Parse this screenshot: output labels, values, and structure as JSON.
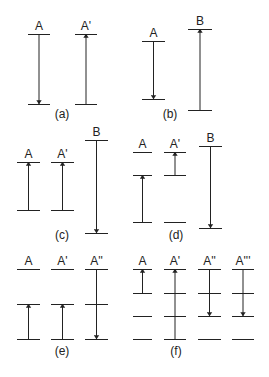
{
  "figure": {
    "stroke_color": "#222222",
    "background": "#ffffff",
    "panels": [
      {
        "id": "a",
        "caption": "(a)",
        "caption_pos": [
          62,
          118
        ],
        "columns": [
          {
            "label": "A",
            "x1": 28,
            "x2": 50,
            "levels": [
              34,
              104
            ],
            "arrow": {
              "from": 34,
              "to": 104,
              "direction": "down"
            }
          },
          {
            "label": "A'",
            "x1": 75,
            "x2": 97,
            "levels": [
              34,
              104
            ],
            "arrow": {
              "from": 104,
              "to": 34,
              "direction": "up"
            }
          }
        ]
      },
      {
        "id": "b",
        "caption": "(b)",
        "caption_pos": [
          170,
          118
        ],
        "columns": [
          {
            "label": "A",
            "x1": 142,
            "x2": 165,
            "levels": [
              41,
              99
            ],
            "arrow": {
              "from": 41,
              "to": 99,
              "direction": "down"
            }
          },
          {
            "label": "B",
            "x1": 188,
            "x2": 212,
            "levels": [
              29,
              110
            ],
            "arrow": {
              "from": 110,
              "to": 29,
              "direction": "up"
            }
          }
        ]
      },
      {
        "id": "c",
        "caption": "(c)",
        "caption_pos": [
          62,
          239
        ],
        "columns": [
          {
            "label": "A",
            "x1": 17,
            "x2": 40,
            "levels": [
              162,
              210
            ],
            "arrow": {
              "from": 210,
              "to": 162,
              "direction": "up"
            }
          },
          {
            "label": "A'",
            "x1": 51,
            "x2": 74,
            "levels": [
              162,
              210
            ],
            "arrow": {
              "from": 210,
              "to": 162,
              "direction": "up"
            }
          },
          {
            "label": "B",
            "x1": 85,
            "x2": 108,
            "levels": [
              140,
              233
            ],
            "arrow": {
              "from": 140,
              "to": 233,
              "direction": "down"
            }
          }
        ]
      },
      {
        "id": "d",
        "caption": "(d)",
        "caption_pos": [
          176,
          239
        ],
        "columns": [
          {
            "label": "A",
            "x1": 133,
            "x2": 152,
            "levels": [
              152,
              175,
              222
            ],
            "arrow": {
              "from": 222,
              "to": 175,
              "direction": "up"
            }
          },
          {
            "label": "A'",
            "x1": 164,
            "x2": 186,
            "levels": [
              152,
              175,
              222
            ],
            "arrow": {
              "from": 175,
              "to": 152,
              "direction": "up"
            }
          },
          {
            "label": "B",
            "x1": 199,
            "x2": 222,
            "levels": [
              146,
              228
            ],
            "arrow": {
              "from": 146,
              "to": 228,
              "direction": "down"
            }
          }
        ]
      },
      {
        "id": "e",
        "caption": "(e)",
        "caption_pos": [
          62,
          355
        ],
        "columns": [
          {
            "label": "A",
            "x1": 17,
            "x2": 40,
            "levels": [
              269,
              304,
              339
            ],
            "arrow": {
              "from": 339,
              "to": 304,
              "direction": "up"
            }
          },
          {
            "label": "A'",
            "x1": 51,
            "x2": 74,
            "levels": [
              269,
              304,
              339
            ],
            "arrow": {
              "from": 339,
              "to": 304,
              "direction": "up"
            }
          },
          {
            "label": "A''",
            "x1": 85,
            "x2": 108,
            "levels": [
              269,
              304,
              339
            ],
            "arrow": {
              "from": 269,
              "to": 339,
              "direction": "down"
            }
          }
        ]
      },
      {
        "id": "f",
        "caption": "(f)",
        "caption_pos": [
          176,
          355
        ],
        "columns": [
          {
            "label": "A",
            "x1": 133,
            "x2": 152,
            "levels": [
              269,
              293,
              316,
              339
            ],
            "arrow": {
              "from": 293,
              "to": 269,
              "direction": "up"
            }
          },
          {
            "label": "A'",
            "x1": 164,
            "x2": 186,
            "levels": [
              269,
              293,
              316,
              339
            ],
            "arrow": {
              "from": 339,
              "to": 269,
              "direction": "up"
            }
          },
          {
            "label": "A''",
            "x1": 198,
            "x2": 221,
            "levels": [
              269,
              293,
              316,
              339
            ],
            "arrow": {
              "from": 269,
              "to": 316,
              "direction": "down"
            }
          },
          {
            "label": "A'''",
            "x1": 232,
            "x2": 254,
            "levels": [
              269,
              293,
              316,
              339
            ],
            "arrow": {
              "from": 269,
              "to": 316,
              "direction": "down"
            }
          }
        ]
      }
    ]
  }
}
